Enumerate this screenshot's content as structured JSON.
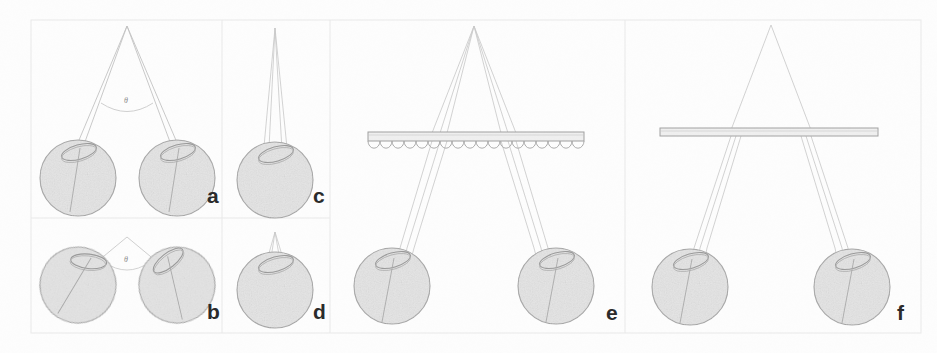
{
  "figure": {
    "width": 937,
    "height": 353,
    "background_color": "#fdfdfd",
    "line_color": "#b9b9b9",
    "eye_fill_color": "#e2e2e2",
    "eye_stroke_color": "#a8a8a8",
    "label_color": "#2b2b2b",
    "grid_color": "#e6e6e6",
    "plate_fill_color": "#efefef",
    "plate_stroke_color": "#a9a9a9"
  },
  "panels": [
    {
      "id": "a",
      "label": "a",
      "label_x": 207,
      "label_y": 196,
      "description": "Wide convergence: two eyes converge on a distant apex point, large vergence angle theta marked with an arc",
      "angle_label": "θ",
      "angle_label_x": 124,
      "angle_label_y": 98,
      "eye_count": 2,
      "has_plate": false,
      "plate_type": "none",
      "apex_x": 127,
      "apex_y": 26
    },
    {
      "id": "b",
      "label": "b",
      "label_x": 207,
      "label_y": 312,
      "description": "Near convergence: two tilted eyes converge on a nearer apex point, wider vergence angle theta marked with an arc",
      "angle_label": "θ",
      "angle_label_x": 124,
      "angle_label_y": 257,
      "eye_count": 2,
      "has_plate": false,
      "plate_type": "none",
      "apex_x": 127,
      "apex_y": 237
    },
    {
      "id": "c",
      "label": "c",
      "label_x": 313,
      "label_y": 196,
      "description": "Single eye with a very narrow ray bundle converging from far above the eye",
      "angle_label": "",
      "angle_label_x": 0,
      "angle_label_y": 0,
      "eye_count": 1,
      "has_plate": false,
      "plate_type": "none",
      "apex_x": 275,
      "apex_y": 28
    },
    {
      "id": "d",
      "label": "d",
      "label_x": 313,
      "label_y": 312,
      "description": "Single eye with a narrow ray bundle converging from a nearer apex above the eye",
      "angle_label": "",
      "angle_label_x": 0,
      "angle_label_y": 0,
      "eye_count": 1,
      "has_plate": false,
      "plate_type": "none",
      "apex_x": 474,
      "apex_y": 238
    },
    {
      "id": "e",
      "label": "e",
      "label_x": 608,
      "label_y": 313,
      "description": "Two eyes viewing through a lenticular lens array sheet; ray bundles cross at an apex above the array",
      "angle_label": "",
      "angle_label_x": 0,
      "angle_label_y": 0,
      "eye_count": 2,
      "has_plate": true,
      "plate_type": "lenticular-array",
      "plate_x": 368,
      "plate_y": 132,
      "plate_width": 216,
      "plate_height": 9,
      "lenslet_count": 18,
      "apex_x": 474,
      "apex_y": 26
    },
    {
      "id": "f",
      "label": "f",
      "label_x": 898,
      "label_y": 313,
      "description": "Two eyes viewing through a flat transparent slab; ray bundles cross at an apex above the slab",
      "angle_label": "",
      "angle_label_x": 0,
      "angle_label_y": 0,
      "eye_count": 2,
      "has_plate": true,
      "plate_type": "flat-slab",
      "plate_x": 660,
      "plate_y": 128,
      "plate_width": 218,
      "plate_height": 8,
      "lenslet_count": 0,
      "apex_x": 771,
      "apex_y": 25
    }
  ],
  "grid": {
    "outer_left": 31,
    "outer_top": 20,
    "outer_right": 921,
    "outer_bottom": 333,
    "vertical_dividers": [
      222,
      330,
      625
    ],
    "horizontal_dividers": [
      218
    ]
  }
}
